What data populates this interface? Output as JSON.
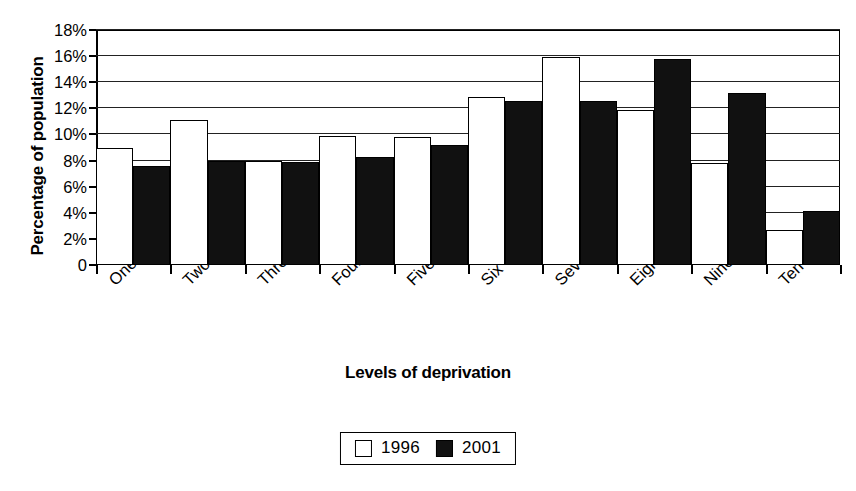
{
  "chart_data": {
    "type": "bar",
    "title": "",
    "xlabel": "Levels of deprivation",
    "ylabel": "Percentage of population",
    "categories": [
      "One",
      "Two",
      "Three",
      "Four",
      "Five",
      "Six",
      "Seven",
      "Eight",
      "Nine",
      "Ten"
    ],
    "series": [
      {
        "name": "1996",
        "color": "#ffffff",
        "values": [
          9.0,
          11.1,
          8.0,
          9.9,
          9.8,
          12.9,
          15.9,
          11.9,
          7.8,
          2.7
        ]
      },
      {
        "name": "2001",
        "color": "#111111",
        "values": [
          7.6,
          8.0,
          7.9,
          8.3,
          9.2,
          12.6,
          12.6,
          15.8,
          13.2,
          4.1
        ]
      }
    ],
    "ylim": [
      0,
      18
    ],
    "ytick_values": [
      0,
      2,
      4,
      6,
      8,
      10,
      12,
      14,
      16,
      18
    ],
    "ytick_labels": [
      "0",
      "2%",
      "4%",
      "6%",
      "8%",
      "10%",
      "12%",
      "14%",
      "16%",
      "18%"
    ],
    "grid": true,
    "grid_axis": "y",
    "legend_position": "bottom-center",
    "xtick_label_rotation": -45
  },
  "legend": {
    "entries": [
      {
        "label": "1996",
        "swatch": "hollow"
      },
      {
        "label": "2001",
        "swatch": "filled"
      }
    ]
  },
  "axes": {
    "y_title": "Percentage of population",
    "x_title": "Levels of deprivation"
  }
}
